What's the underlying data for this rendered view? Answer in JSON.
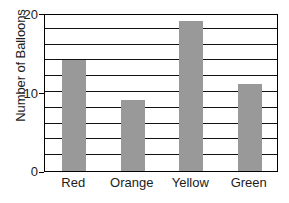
{
  "chart_data": {
    "type": "bar",
    "title": "",
    "xlabel": "",
    "ylabel": "Number of Balloons",
    "categories": [
      "Red",
      "Orange",
      "Yellow",
      "Green"
    ],
    "values": [
      14,
      9,
      19,
      11
    ],
    "ylim": [
      0,
      20
    ],
    "y_tick_labels": [
      "0",
      "10",
      "20"
    ],
    "y_tick_values": [
      0,
      10,
      20
    ],
    "gridline_interval": 2,
    "gridline_values": [
      2,
      4,
      6,
      8,
      10,
      12,
      14,
      16,
      18
    ],
    "grid": true,
    "legend": false,
    "series": [
      {
        "name": "Number of Balloons",
        "values": [
          14,
          9,
          19,
          11
        ]
      }
    ],
    "colors": {
      "bar_fill": "#999999",
      "axis": "#000000",
      "gridline": "#111111",
      "background": "#ffffff",
      "text": "#1c1c1c"
    }
  }
}
